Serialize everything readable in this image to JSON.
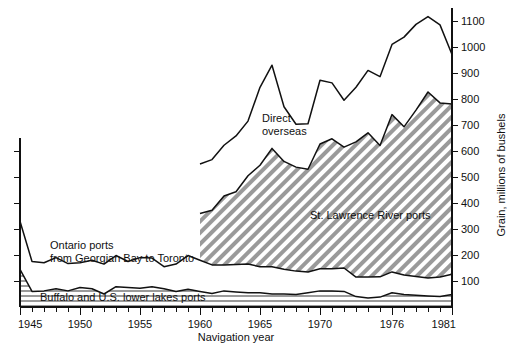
{
  "chart_data": {
    "type": "area",
    "title": "",
    "xlabel": "Navigation year",
    "ylabel": "Grain, millions of bushels",
    "xlim": [
      1945,
      1981
    ],
    "ylim": [
      0,
      1150
    ],
    "x_ticks": [
      1945,
      1950,
      1955,
      1960,
      1965,
      1970,
      1976,
      1981
    ],
    "x_tick_labels": [
      "1945",
      "1950",
      "1955",
      "1960",
      "1965",
      "1970",
      "1976",
      "1981"
    ],
    "x_minor_tick_step": 1,
    "y_ticks": [
      100,
      200,
      300,
      400,
      500,
      600,
      700,
      800,
      900,
      1000,
      1100
    ],
    "y_tick_labels": [
      "100",
      "200",
      "300",
      "400",
      "500",
      "600",
      "700",
      "800",
      "900",
      "1000",
      "1100"
    ],
    "grid": false,
    "legend_position": "inline-annotations",
    "stacking": "cumulative",
    "x": [
      1945,
      1946,
      1947,
      1948,
      1949,
      1950,
      1951,
      1952,
      1953,
      1954,
      1955,
      1956,
      1957,
      1958,
      1959,
      1960,
      1961,
      1962,
      1963,
      1964,
      1965,
      1966,
      1967,
      1968,
      1969,
      1970,
      1971,
      1972,
      1973,
      1974,
      1975,
      1976,
      1977,
      1978,
      1979,
      1980,
      1981
    ],
    "series": [
      {
        "name": "Buffalo and U.S. lower lakes ports",
        "fill": "horizontal-hatch",
        "values": [
          145,
          60,
          62,
          70,
          62,
          75,
          70,
          50,
          78,
          75,
          72,
          78,
          70,
          60,
          68,
          60,
          52,
          62,
          58,
          55,
          55,
          50,
          50,
          48,
          55,
          62,
          62,
          60,
          40,
          35,
          38,
          55,
          48,
          45,
          42,
          40,
          48
        ]
      },
      {
        "name": "Ontario ports from Georgian Bay to Toronto",
        "fill": "white",
        "values": [
          185,
          115,
          108,
          120,
          105,
          95,
          110,
          115,
          120,
          100,
          118,
          110,
          85,
          105,
          130,
          120,
          110,
          100,
          105,
          110,
          100,
          105,
          95,
          90,
          80,
          85,
          85,
          90,
          75,
          80,
          78,
          80,
          75,
          72,
          70,
          75,
          78
        ]
      },
      {
        "name": "St. Lawrence River ports",
        "fill": "diagonal-hatch",
        "values": [
          0,
          0,
          0,
          0,
          0,
          0,
          0,
          0,
          0,
          0,
          0,
          0,
          0,
          0,
          0,
          180,
          210,
          265,
          280,
          340,
          390,
          455,
          415,
          400,
          395,
          480,
          500,
          465,
          520,
          555,
          505,
          605,
          570,
          640,
          715,
          670,
          655
        ]
      },
      {
        "name": "Direct overseas",
        "fill": "white",
        "values": [
          0,
          0,
          0,
          0,
          0,
          0,
          0,
          0,
          0,
          0,
          0,
          0,
          0,
          0,
          0,
          190,
          195,
          195,
          215,
          210,
          300,
          320,
          210,
          165,
          175,
          245,
          215,
          180,
          210,
          240,
          265,
          270,
          345,
          330,
          290,
          300,
          190
        ]
      }
    ],
    "cumulative_totals_note": "Bands are stacked; upper boundary of 'Direct overseas' is total grain shipments.",
    "annotations": [
      {
        "text": "Direct overseas",
        "lines": [
          "Direct",
          "overseas"
        ],
        "x": 262,
        "y": 122
      },
      {
        "text": "St. Lawrence River ports",
        "lines": [
          "St. Lawrence River ports"
        ],
        "x": 310,
        "y": 219
      },
      {
        "text": "Ontario ports from Georgian Bay to Toronto",
        "lines": [
          "Ontario ports",
          "from Georgian Bay to Toronto"
        ],
        "x": 50,
        "y": 249
      },
      {
        "text": "Buffalo and U.S. lower lakes ports",
        "lines": [
          "Buffalo and U.S. lower lakes ports"
        ],
        "x": 40,
        "y": 301
      }
    ]
  },
  "colors": {
    "line": "#111111",
    "hatch": "#8c8c8c",
    "background": "#ffffff",
    "axis": "#111111"
  }
}
